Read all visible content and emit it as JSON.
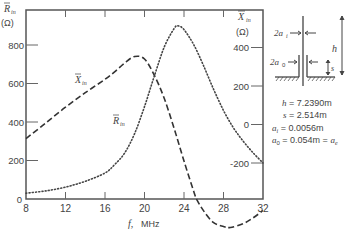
{
  "chart_data": {
    "type": "line",
    "title": "",
    "xlabel": "f, MHz",
    "ylabel_left": "R̄in (Ω)",
    "ylabel_right": "X̄in (Ω)",
    "xlim": [
      8,
      32
    ],
    "ylim_left": [
      0,
      980
    ],
    "ylim_right": [
      -640,
      400
    ],
    "x_ticks": [
      8,
      12,
      16,
      20,
      24,
      28,
      32
    ],
    "y_ticks_left": [
      0,
      200,
      400,
      600,
      800
    ],
    "y_ticks_right": [
      -200,
      0,
      200,
      400
    ],
    "grid": false,
    "legend": "inline curve labels",
    "series": [
      {
        "name": "X̄in",
        "axis": "right",
        "style": "dashed",
        "x": [
          8,
          10,
          12,
          14,
          16,
          17,
          18,
          19,
          20,
          21,
          22,
          23,
          24,
          25,
          25.3,
          26,
          27,
          28,
          28.7,
          30,
          31,
          32
        ],
        "values": [
          -73,
          8,
          90,
          165,
          235,
          275,
          320,
          353,
          340,
          255,
          135,
          -20,
          -190,
          -350,
          -390,
          -450,
          -510,
          -530,
          -535,
          -515,
          -485,
          -447
        ]
      },
      {
        "name": "R̄in",
        "axis": "left",
        "style": "dotted",
        "x": [
          8,
          10,
          12,
          14,
          16,
          17,
          18,
          19,
          20,
          21,
          22,
          23,
          23.4,
          24,
          25,
          26,
          27,
          28,
          29,
          30,
          31,
          32
        ],
        "values": [
          30,
          42,
          62,
          92,
          135,
          180,
          240,
          340,
          480,
          640,
          790,
          885,
          899,
          880,
          800,
          690,
          570,
          460,
          370,
          300,
          240,
          187
        ]
      }
    ],
    "annotations": [
      {
        "text": "h = 7.2390m"
      },
      {
        "text": "s = 2.514m"
      },
      {
        "text": "a_i = 0.0056m"
      },
      {
        "text": "a_o = 0.054m = a_e"
      }
    ]
  },
  "labels": {
    "left_axis_symbol": "R",
    "left_axis_sub": "in",
    "left_axis_unit": "(Ω)",
    "right_axis_symbol": "X",
    "right_axis_sub": "in",
    "right_axis_unit": "(Ω)",
    "xlabel_f": "f,",
    "xlabel_unit": "MHz",
    "curve_x_symbol": "X",
    "curve_x_sub": "in",
    "curve_r_symbol": "R",
    "curve_r_sub": "in",
    "diagram_2ai": "2a",
    "diagram_2ai_sub": "i",
    "diagram_2ao": "2a",
    "diagram_2ao_sub": "0",
    "diagram_h": "h",
    "diagram_s": "s"
  },
  "params": {
    "h_sym": "h",
    "h_val": " = 7.2390m",
    "s_sym": "s",
    "s_val": " = 2.514m",
    "ai_sym": "a",
    "ai_sub": "i",
    "ai_val": " = 0.0056m",
    "ao_sym": "a",
    "ao_sub": "0",
    "ao_val": " = 0.054m = ",
    "ae_sym": "a",
    "ae_sub": "e"
  }
}
